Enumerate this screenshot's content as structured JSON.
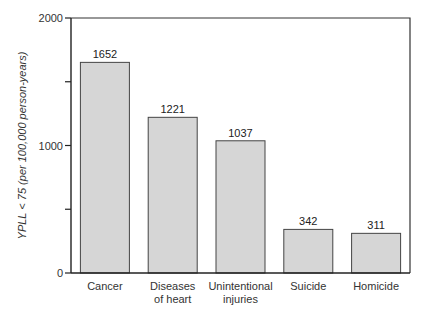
{
  "chart_data": {
    "type": "bar",
    "title": "",
    "xlabel": "",
    "ylabel": "YPLL < 75 (per 100,000 person-years)",
    "categories": [
      [
        "Cancer"
      ],
      [
        "Diseases",
        "of heart"
      ],
      [
        "Unintentional",
        "injuries"
      ],
      [
        "Suicide"
      ],
      [
        "Homicide"
      ]
    ],
    "values": [
      1652,
      1221,
      1037,
      342,
      311
    ],
    "ylim": [
      0,
      2000
    ],
    "yticks": [
      0,
      500,
      1000,
      1500,
      2000
    ],
    "ytick_labels": [
      "0",
      "",
      "1000",
      "",
      "2000"
    ],
    "grid": false,
    "legend": null,
    "bar_color": "#d6d6d6",
    "bar_edge_color": "#444444"
  }
}
